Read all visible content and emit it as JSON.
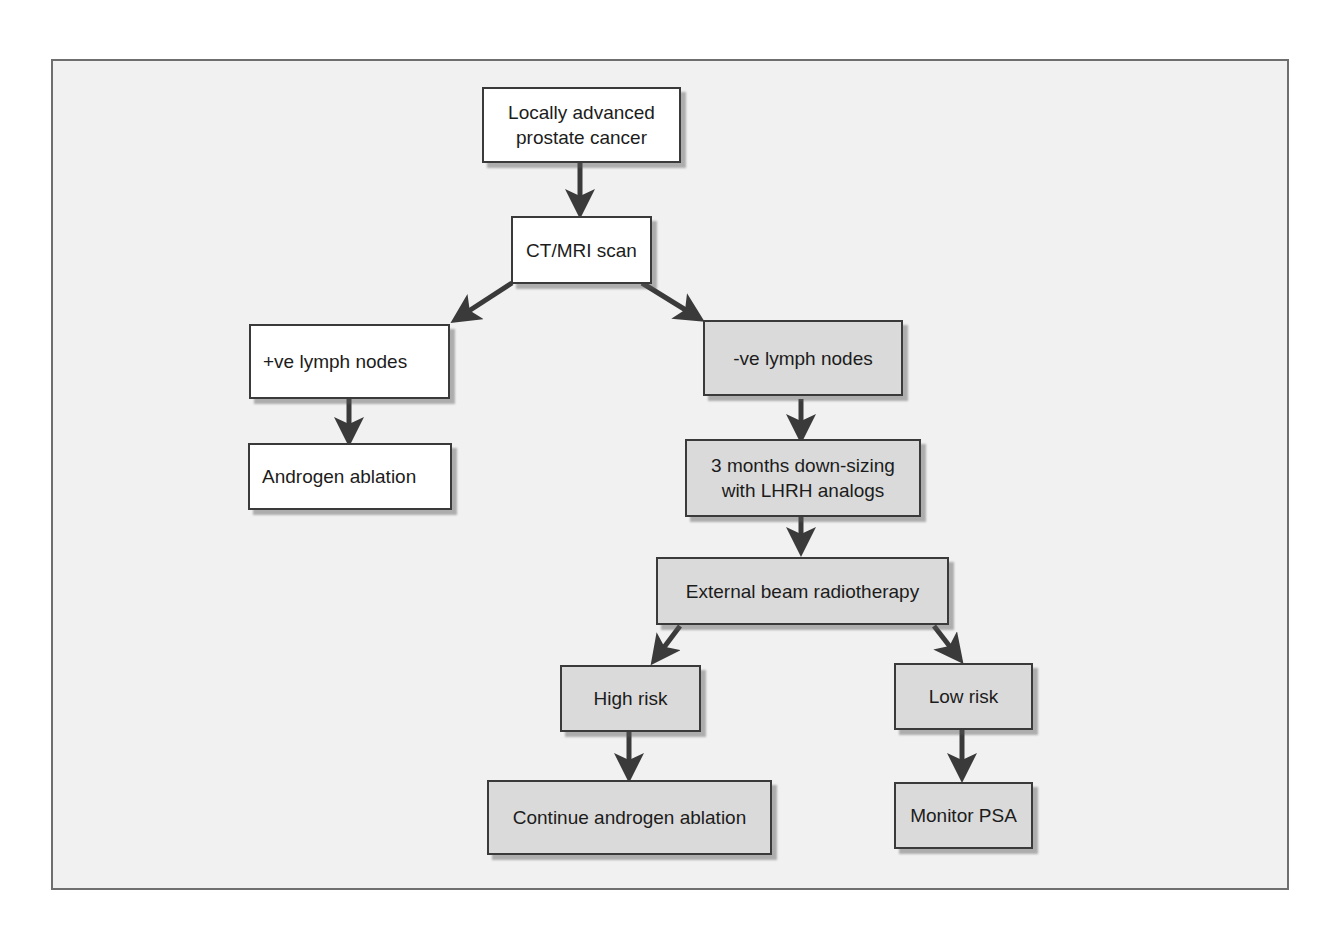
{
  "diagram": {
    "colors": {
      "background": "#f1f1f1",
      "frame_border": "#6f6f6f",
      "white_box": "#ffffff",
      "gray_box": "#dadada",
      "box_border": "#3a3a3a",
      "arrow": "#3a3a3a"
    },
    "nodes": [
      {
        "id": "locally-advanced",
        "label": "Locally advanced\nprostate cancer",
        "style": "white"
      },
      {
        "id": "ct-mri",
        "label": "CT/MRI scan",
        "style": "white"
      },
      {
        "id": "pos-lymph",
        "label": "+ve lymph nodes",
        "style": "white"
      },
      {
        "id": "androgen-ablation",
        "label": "Androgen ablation",
        "style": "white"
      },
      {
        "id": "neg-lymph",
        "label": "-ve lymph nodes",
        "style": "gray"
      },
      {
        "id": "downsizing",
        "label": "3 months down-sizing\nwith LHRH analogs",
        "style": "gray"
      },
      {
        "id": "ebrt",
        "label": "External beam radiotherapy",
        "style": "gray"
      },
      {
        "id": "high-risk",
        "label": "High risk",
        "style": "gray"
      },
      {
        "id": "low-risk",
        "label": "Low risk",
        "style": "gray"
      },
      {
        "id": "continue-ablation",
        "label": "Continue androgen ablation",
        "style": "gray"
      },
      {
        "id": "monitor-psa",
        "label": "Monitor PSA",
        "style": "gray"
      }
    ],
    "edges": [
      {
        "from": "locally-advanced",
        "to": "ct-mri"
      },
      {
        "from": "ct-mri",
        "to": "pos-lymph"
      },
      {
        "from": "ct-mri",
        "to": "neg-lymph"
      },
      {
        "from": "pos-lymph",
        "to": "androgen-ablation"
      },
      {
        "from": "neg-lymph",
        "to": "downsizing"
      },
      {
        "from": "downsizing",
        "to": "ebrt"
      },
      {
        "from": "ebrt",
        "to": "high-risk"
      },
      {
        "from": "ebrt",
        "to": "low-risk"
      },
      {
        "from": "high-risk",
        "to": "continue-ablation"
      },
      {
        "from": "low-risk",
        "to": "monitor-psa"
      }
    ]
  }
}
